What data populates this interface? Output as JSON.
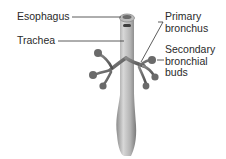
{
  "diagram": {
    "type": "anatomical-illustration",
    "labels": {
      "esophagus": "Esophagus",
      "trachea": "Trachea",
      "primary_bronchus": [
        "Primary",
        "bronchus"
      ],
      "secondary_bronchial_buds": [
        "Secondary",
        "bronchial",
        "buds"
      ]
    },
    "colors": {
      "tissue_light": "#cfcfcf",
      "tissue_mid": "#9a9a9a",
      "tissue_dark": "#5e5e5e",
      "leader_line": "#333333",
      "text": "#2a2a2a"
    }
  }
}
